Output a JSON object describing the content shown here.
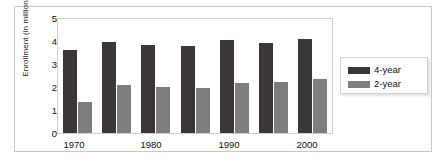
{
  "chart_data": {
    "type": "bar",
    "title": "",
    "xlabel": "",
    "ylabel": "Enrollment (in millions)",
    "ylim": [
      0,
      5
    ],
    "yticks": [
      "0",
      "1",
      "2",
      "3",
      "4",
      "5"
    ],
    "grid": false,
    "legend_position": "right",
    "categories": [
      "1970",
      "1975",
      "1980",
      "1985",
      "1990",
      "1995",
      "2000"
    ],
    "tick_labels": [
      "1970",
      "",
      "1980",
      "",
      "1990",
      "",
      "2000"
    ],
    "visible_xtick_labels": [
      "1970",
      "1980",
      "1990",
      "2000"
    ],
    "series": [
      {
        "name": "4-year",
        "color": "#3b3739",
        "values": [
          3.65,
          4.0,
          3.85,
          3.8,
          4.1,
          3.95,
          4.12
        ]
      },
      {
        "name": "2-year",
        "color": "#7e7e7e",
        "values": [
          1.35,
          2.12,
          2.02,
          1.98,
          2.2,
          2.25,
          2.35
        ]
      }
    ]
  },
  "legend": {
    "items": [
      {
        "label": "4-year",
        "color": "#3b3739"
      },
      {
        "label": "2-year",
        "color": "#7e7e7e"
      }
    ]
  },
  "axis": {
    "y_label": "Enrollment (in millions)",
    "y_tick_0": "0",
    "y_tick_1": "1",
    "y_tick_2": "2",
    "y_tick_3": "3",
    "y_tick_4": "4",
    "y_tick_5": "5",
    "x_tick_0": "1970",
    "x_tick_1": "1980",
    "x_tick_2": "1990",
    "x_tick_3": "2000"
  },
  "colors": {
    "series_4year": "#3b3739",
    "series_2year": "#7e7e7e",
    "frame": "#cfcfcf",
    "outer_frame": "#c9c9c9",
    "background": "#ffffff"
  }
}
